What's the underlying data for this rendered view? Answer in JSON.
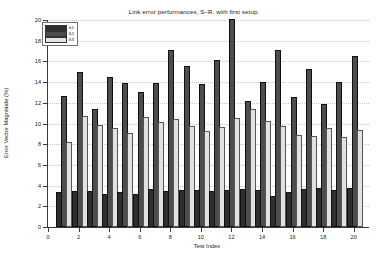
{
  "chart_data": {
    "type": "bar",
    "title": "Link error performances, S–R, with first setup.",
    "xlabel": "Test Index",
    "ylabel": "Error Vector Magnitude (%)",
    "xlim": [
      0,
      21
    ],
    "ylim": [
      0,
      20
    ],
    "xticks": [
      0,
      2,
      4,
      6,
      8,
      10,
      12,
      14,
      16,
      18,
      20
    ],
    "yticks": [
      0,
      2,
      4,
      6,
      8,
      10,
      12,
      14,
      16,
      18,
      20
    ],
    "grid": true,
    "legend_position": "upper-left",
    "categories": [
      1,
      2,
      3,
      4,
      5,
      6,
      7,
      8,
      9,
      10,
      11,
      12,
      13,
      14,
      15,
      16,
      17,
      18,
      19,
      20
    ],
    "series": [
      {
        "name": "S1",
        "color": "#2e2e2e",
        "values": [
          3.2,
          3.3,
          3.3,
          3.0,
          3.2,
          3.0,
          3.5,
          3.3,
          3.4,
          3.35,
          3.25,
          3.35,
          3.45,
          3.35,
          2.8,
          3.2,
          3.5,
          3.6,
          3.4,
          3.55
        ]
      },
      {
        "name": "S2",
        "color": "#4d4d4d",
        "values": [
          12.45,
          14.75,
          11.25,
          14.3,
          13.75,
          12.85,
          13.75,
          16.95,
          15.4,
          13.65,
          15.95,
          19.9,
          11.95,
          13.8,
          16.9,
          12.35,
          15.05,
          11.7,
          13.8,
          16.3
        ]
      },
      {
        "name": "S3",
        "color": "#e2e2e2",
        "values": [
          8.0,
          10.55,
          9.7,
          9.35,
          8.85,
          10.45,
          9.95,
          10.25,
          9.6,
          9.1,
          9.5,
          10.3,
          11.2,
          10.05,
          9.55,
          8.7,
          8.6,
          9.35,
          8.5,
          9.15
        ]
      }
    ]
  }
}
